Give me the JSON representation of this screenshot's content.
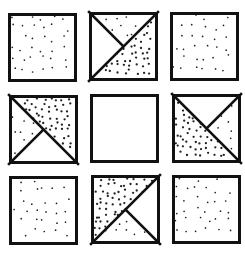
{
  "figure": {
    "type": "3x3 pattern matrix",
    "background": "#ffffff",
    "stroke_color": "#111111",
    "dot_color": "#222222",
    "tile_size": 69,
    "border_width": 3,
    "fill_legend": {
      "blank": "no dots",
      "sparse": "widely spaced small dots",
      "dense": "closely spaced dots"
    },
    "tiles": [
      {
        "row": 1,
        "col": 1,
        "x": 8,
        "y": 13,
        "style": "sparse-full",
        "regions": [
          {
            "shape": "square",
            "fill": "sparse"
          }
        ]
      },
      {
        "row": 1,
        "col": 2,
        "x": 89,
        "y": 12,
        "style": "split",
        "diagonal": "anti",
        "spoke": "top-left",
        "regions": [
          {
            "shape": "left-triangle",
            "fill": "blank"
          },
          {
            "shape": "top-triangle",
            "fill": "sparse"
          },
          {
            "shape": "lower-right-half",
            "fill": "dense"
          }
        ]
      },
      {
        "row": 1,
        "col": 3,
        "x": 170,
        "y": 12,
        "style": "sparse-full",
        "regions": [
          {
            "shape": "square",
            "fill": "sparse"
          }
        ]
      },
      {
        "row": 2,
        "col": 1,
        "x": 9,
        "y": 95,
        "style": "split",
        "diagonal": "main",
        "spoke": "bottom-left",
        "regions": [
          {
            "shape": "upper-right-half",
            "fill": "dense"
          },
          {
            "shape": "left-triangle",
            "fill": "sparse"
          },
          {
            "shape": "bottom-triangle",
            "fill": "blank"
          }
        ]
      },
      {
        "row": 2,
        "col": 2,
        "x": 90,
        "y": 94,
        "style": "blank",
        "regions": [
          {
            "shape": "square",
            "fill": "blank"
          }
        ]
      },
      {
        "row": 2,
        "col": 3,
        "x": 172,
        "y": 94,
        "style": "split",
        "diagonal": "main",
        "spoke": "top-right",
        "regions": [
          {
            "shape": "lower-left-half",
            "fill": "dense"
          },
          {
            "shape": "top-triangle",
            "fill": "blank"
          },
          {
            "shape": "right-triangle",
            "fill": "sparse"
          }
        ]
      },
      {
        "row": 3,
        "col": 1,
        "x": 9,
        "y": 176,
        "style": "sparse-full",
        "regions": [
          {
            "shape": "square",
            "fill": "sparse"
          }
        ]
      },
      {
        "row": 3,
        "col": 2,
        "x": 91,
        "y": 175,
        "style": "split",
        "diagonal": "anti",
        "spoke": "bottom-right",
        "regions": [
          {
            "shape": "upper-left-half",
            "fill": "dense"
          },
          {
            "shape": "right-triangle",
            "fill": "blank"
          },
          {
            "shape": "bottom-triangle",
            "fill": "sparse"
          }
        ]
      },
      {
        "row": 3,
        "col": 3,
        "x": 172,
        "y": 175,
        "style": "sparse-full",
        "regions": [
          {
            "shape": "square",
            "fill": "sparse"
          }
        ]
      }
    ]
  }
}
